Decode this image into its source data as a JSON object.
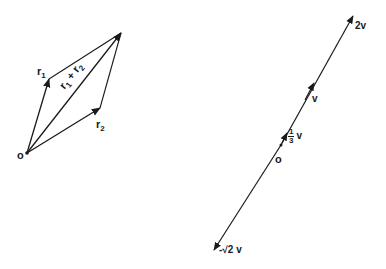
{
  "colors": {
    "ink": "#1a1a1a",
    "background": "#ffffff"
  },
  "left_figure": {
    "title": "Parallelogram law of vector addition",
    "origin_label": "o",
    "vectors": [
      {
        "name": "r1",
        "label_base": "r",
        "label_sub": "1",
        "from": [
          27,
          153
        ],
        "to": [
          49,
          79
        ]
      },
      {
        "name": "r2",
        "label_base": "r",
        "label_sub": "2",
        "from": [
          27,
          153
        ],
        "to": [
          100,
          108
        ]
      },
      {
        "name": "r1_plus_r2",
        "label": "r₁ + r₂",
        "label_base1": "r",
        "label_sub1": "1",
        "label_plus": "+",
        "label_base2": "r",
        "label_sub2": "2",
        "from": [
          27,
          153
        ],
        "to": [
          121,
          33
        ]
      }
    ],
    "parallelogram_sides": [
      {
        "from": [
          49,
          79
        ],
        "to": [
          121,
          33
        ]
      },
      {
        "from": [
          100,
          108
        ],
        "to": [
          121,
          33
        ]
      }
    ]
  },
  "right_figure": {
    "title": "Scalar multiples of a vector v",
    "origin_label": "o",
    "line": {
      "from": [
        214,
        250
      ],
      "to": [
        353,
        16
      ]
    },
    "multiples": [
      {
        "name": "2v",
        "label": "2v",
        "tip": [
          353,
          16
        ]
      },
      {
        "name": "v",
        "label": "v",
        "tip": [
          314,
          83
        ]
      },
      {
        "name": "one_third_v",
        "label_num": "1",
        "label_den": "3",
        "label_var": "v",
        "tip": [
          287,
          133
        ]
      },
      {
        "name": "neg_sqrt2_v",
        "label": "-√2 v",
        "tip": [
          214,
          250
        ]
      }
    ],
    "origin_point": [
      281,
      145
    ]
  }
}
